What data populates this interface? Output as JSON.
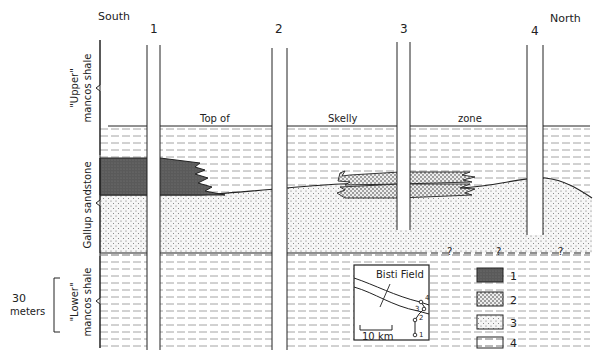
{
  "directions": {
    "south": "South",
    "north": "North"
  },
  "wells": [
    {
      "id": "1",
      "label": "1"
    },
    {
      "id": "2",
      "label": "2"
    },
    {
      "id": "3",
      "label": "3"
    },
    {
      "id": "4",
      "label": "4"
    }
  ],
  "formations": {
    "upper": {
      "line1": "\"Upper\"",
      "line2": "mancos shale"
    },
    "gallup": {
      "line1": "Gallup sandstone"
    },
    "lower": {
      "line1": "\"Lower\"",
      "line2": "mancos shale"
    }
  },
  "zone_label": {
    "part1": "Top of",
    "part2": "Skelly",
    "part3": "zone"
  },
  "scale_bar": {
    "value": "30",
    "unit": "meters"
  },
  "uncertain_marker": "?",
  "inset_map": {
    "title": "Bisti Field",
    "scale": "10 km",
    "well_labels": [
      "1",
      "2",
      "3",
      "4"
    ]
  },
  "legend": [
    {
      "key": "1",
      "pattern": "dark-shaded"
    },
    {
      "key": "2",
      "pattern": "dense-dots"
    },
    {
      "key": "3",
      "pattern": "sparse-dots"
    },
    {
      "key": "4",
      "pattern": "dashed-shale"
    }
  ],
  "colors": {
    "ink": "#222222",
    "dark_unit": "#555555",
    "shale_dash": "#9a9a9a",
    "background": "#ffffff"
  }
}
